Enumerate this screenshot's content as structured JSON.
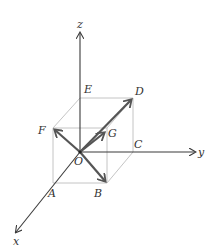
{
  "diagram": {
    "type": "3d-coordinate-cube-vectors",
    "axes": {
      "x": "x",
      "y": "y",
      "z": "z"
    },
    "origin": "O",
    "points": {
      "A": "A",
      "B": "B",
      "C": "C",
      "D": "D",
      "E": "E",
      "F": "F",
      "G": "G"
    },
    "vectors": [
      "OF",
      "OG",
      "OD",
      "OB"
    ],
    "colors": {
      "axis": "#3a3a3a",
      "vector": "#555555",
      "cube_edge": "#bdbdbd",
      "label": "#333333"
    }
  }
}
